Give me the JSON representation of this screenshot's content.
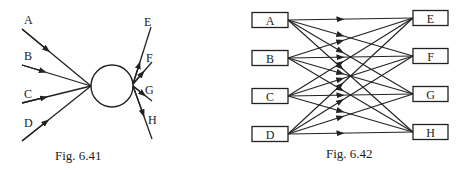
{
  "figures": [
    {
      "id": "fig641",
      "caption": "Fig. 6.41",
      "type": "vertex-diagram",
      "center_shape": "circle",
      "incoming": [
        "A",
        "B",
        "C",
        "D"
      ],
      "outgoing": [
        "E",
        "F",
        "G",
        "H"
      ]
    },
    {
      "id": "fig642",
      "caption": "Fig. 6.42",
      "type": "bipartite-network",
      "left_nodes": [
        "A",
        "B",
        "C",
        "D"
      ],
      "right_nodes": [
        "E",
        "F",
        "G",
        "H"
      ],
      "edges": "every left node connects to every right node (16 arrows)"
    }
  ],
  "colors": {
    "stroke": "#222222",
    "background": "#ffffff"
  }
}
